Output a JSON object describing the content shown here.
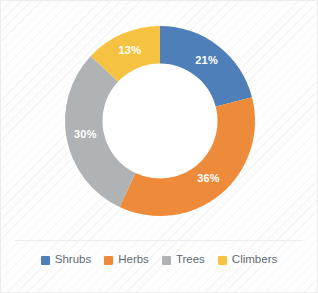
{
  "chart_data": {
    "type": "pie",
    "variant": "donut",
    "title": "",
    "subtitle": "",
    "xlabel": "",
    "ylabel": "",
    "grid": false,
    "legend_position": "bottom",
    "start_angle_deg": 0,
    "direction": "clockwise",
    "hole_ratio": 0.6,
    "categories": [
      "Shrubs",
      "Herbs",
      "Trees",
      "Climbers"
    ],
    "values": [
      21,
      36,
      30,
      13
    ],
    "unit": "%",
    "data_labels": [
      "21%",
      "36%",
      "30%",
      "13%"
    ],
    "colors": [
      "#4E7FB8",
      "#ED8B3A",
      "#B0B3B6",
      "#F6C242"
    ],
    "slices": [
      {
        "label": "Shrubs",
        "value": 21,
        "data_label": "21%",
        "color": "#4E7FB8"
      },
      {
        "label": "Herbs",
        "value": 36,
        "data_label": "36%",
        "color": "#ED8B3A"
      },
      {
        "label": "Trees",
        "value": 30,
        "data_label": "30%",
        "color": "#B0B3B6"
      },
      {
        "label": "Climbers",
        "value": 13,
        "data_label": "13%",
        "color": "#F6C242"
      }
    ]
  },
  "legend": {
    "items": [
      {
        "label": "Shrubs",
        "color": "#4E7FB8"
      },
      {
        "label": "Herbs",
        "color": "#ED8B3A"
      },
      {
        "label": "Trees",
        "color": "#B0B3B6"
      },
      {
        "label": "Climbers",
        "color": "#F6C242"
      }
    ]
  },
  "style": {
    "panel_background": "#FEFEFE",
    "panel_border": "#ECECED",
    "hole_fill": "#FFFFFF",
    "label_text_color": "#FFFFFF",
    "legend_text_color": "#5F6B77"
  }
}
